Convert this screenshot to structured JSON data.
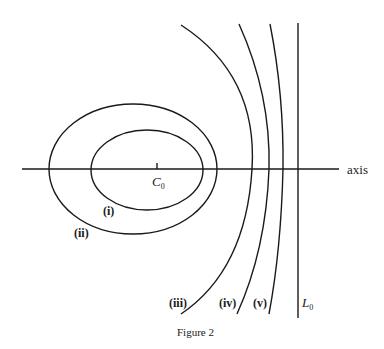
{
  "figure": {
    "caption": "Figure 2",
    "axis_label": "axis",
    "center_label": {
      "main": "C",
      "sub": "0"
    },
    "line_label": {
      "main": "L",
      "sub": "0"
    },
    "curve_labels": {
      "i": "(i)",
      "ii": "(ii)",
      "iii": "(iii)",
      "iv": "(iv)",
      "v": "(v)"
    },
    "stroke_color": "#1a1a1a",
    "background_color": "#ffffff"
  }
}
